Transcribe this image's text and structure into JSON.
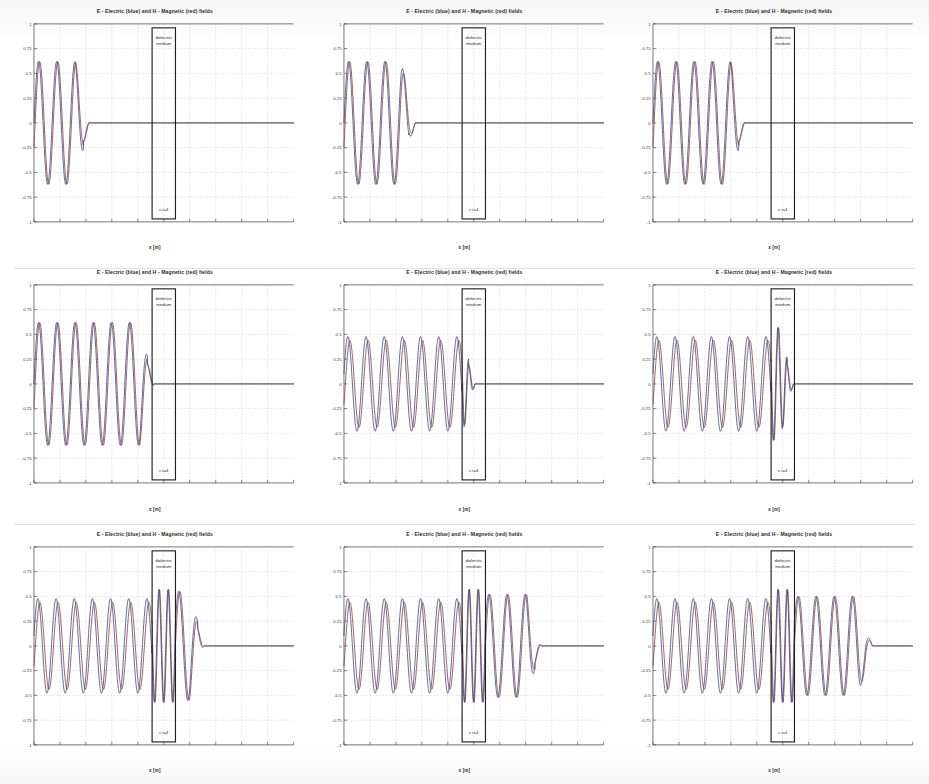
{
  "figure": {
    "kind": "fdtd-wave-snapshot-grid",
    "rows": 3,
    "cols": 3,
    "panel_count": 9
  },
  "plot_common": {
    "title": "E - Electric (blue) and H - Magnetic (red) fields",
    "xlabel": "x [m]",
    "ylabel": "",
    "dielectric_label_line1": "dielectric",
    "dielectric_label_line2": "medium",
    "dielectric_epsilon_label": "ε r=4",
    "grid": "on",
    "legend": "none",
    "colors": {
      "electric_field": "#4b4b7a",
      "magnetic_field": "#7a4b4b",
      "axis": "#3a3a3a",
      "gridline": "#b9b9c4",
      "dielectric_box": "#1f1f1f",
      "background": "#ffffff"
    }
  },
  "axes": {
    "ylim": [
      -1,
      1
    ],
    "yticks": [
      1,
      0.75,
      0.5,
      0.25,
      0,
      -0.25,
      -0.5,
      -0.75,
      -1
    ],
    "ytick_labels": [
      "1",
      "0.75",
      "0.5",
      "0.25",
      "0",
      "-0.25",
      "-0.5",
      "-0.75",
      "-1"
    ],
    "xlim": [
      0,
      10
    ],
    "xticks": [
      0,
      1,
      2,
      3,
      4,
      5,
      6,
      7,
      8,
      9,
      10
    ],
    "xtick_labels": [
      "",
      "",
      "",
      "",
      "",
      "",
      "",
      "",
      "",
      "",
      ""
    ],
    "dielectric_x_start": 4.55,
    "dielectric_x_end": 5.45
  },
  "chart_data": {
    "type": "line",
    "title": "E - Electric (blue) and H - Magnetic (red) fields",
    "xlabel": "x [m]",
    "ylabel": "",
    "xlim": [
      0,
      10
    ],
    "ylim": [
      -1,
      1
    ],
    "grid": true,
    "legend_position": "none",
    "annotations": [
      {
        "text": "dielectric medium",
        "x": 5.0,
        "y": 0.88
      },
      {
        "text": "ε r=4",
        "x": 5.0,
        "y": -0.82
      }
    ],
    "regions": [
      {
        "name": "free-space-left",
        "x_range": [
          0,
          4.55
        ],
        "epsilon_r": 1
      },
      {
        "name": "dielectric-slab",
        "x_range": [
          4.55,
          5.45
        ],
        "epsilon_r": 4
      },
      {
        "name": "free-space-right",
        "x_range": [
          5.45,
          10
        ],
        "epsilon_r": 1
      }
    ],
    "series": [
      {
        "name": "E - Electric field",
        "color": "#4b4b7a"
      },
      {
        "name": "H - Magnetic field",
        "color": "#7a4b4b"
      }
    ],
    "panels": [
      {
        "index": 1,
        "row": 1,
        "col": 1,
        "snapshot": "early",
        "wave_front_x": 2.15,
        "wave_tail_x": 0.0,
        "cycles_visible": 3,
        "wavelength_free": 0.7,
        "amplitude": 0.62,
        "in_dielectric": false,
        "transmitted": false,
        "reflected": false
      },
      {
        "index": 2,
        "row": 1,
        "col": 2,
        "snapshot": "early",
        "wave_front_x": 2.75,
        "wave_tail_x": 0.0,
        "cycles_visible": 4,
        "wavelength_free": 0.7,
        "amplitude": 0.62,
        "in_dielectric": false,
        "transmitted": false,
        "reflected": false
      },
      {
        "index": 3,
        "row": 1,
        "col": 3,
        "snapshot": "early",
        "wave_front_x": 3.55,
        "wave_tail_x": 0.0,
        "cycles_visible": 6,
        "wavelength_free": 0.7,
        "amplitude": 0.62,
        "in_dielectric": false,
        "transmitted": false,
        "reflected": false
      },
      {
        "index": 4,
        "row": 2,
        "col": 1,
        "snapshot": "arriving-at-slab",
        "wave_front_x": 4.62,
        "wave_tail_x": 0.0,
        "cycles_visible": 9,
        "wavelength_free": 0.7,
        "amplitude": 0.62,
        "in_dielectric": false,
        "transmitted": false,
        "reflected": false
      },
      {
        "index": 5,
        "row": 2,
        "col": 2,
        "snapshot": "entering-slab",
        "wave_front_x": 5.05,
        "wave_tail_x": 0.0,
        "cycles_visible": 10,
        "wavelength_free": 0.7,
        "wavelength_dielectric": 0.35,
        "amplitude": 0.62,
        "in_dielectric": true,
        "transmitted": false,
        "reflected": true
      },
      {
        "index": 6,
        "row": 2,
        "col": 3,
        "snapshot": "filling-slab",
        "wave_front_x": 5.42,
        "wave_tail_x": 0.0,
        "cycles_visible": 11,
        "wavelength_free": 0.7,
        "wavelength_dielectric": 0.35,
        "amplitude": 0.62,
        "in_dielectric": true,
        "transmitted": false,
        "reflected": true
      },
      {
        "index": 7,
        "row": 3,
        "col": 1,
        "snapshot": "first-transmission",
        "wave_front_x": 6.55,
        "wave_tail_x": 0.0,
        "cycles_visible": 12,
        "wavelength_free": 0.7,
        "wavelength_dielectric": 0.35,
        "amplitude": 0.62,
        "transmitted_amplitude": 0.55,
        "in_dielectric": true,
        "transmitted": true,
        "reflected": true
      },
      {
        "index": 8,
        "row": 3,
        "col": 2,
        "snapshot": "transmitting",
        "wave_front_x": 7.6,
        "wave_tail_x": 0.0,
        "cycles_visible": 13,
        "wavelength_free": 0.7,
        "wavelength_dielectric": 0.35,
        "amplitude": 0.62,
        "transmitted_amplitude": 0.52,
        "in_dielectric": true,
        "transmitted": true,
        "reflected": true
      },
      {
        "index": 9,
        "row": 3,
        "col": 3,
        "snapshot": "fully-transmitting",
        "wave_front_x": 8.45,
        "wave_tail_x": 0.0,
        "cycles_visible": 14,
        "wavelength_free": 0.7,
        "wavelength_dielectric": 0.35,
        "amplitude": 0.62,
        "transmitted_amplitude": 0.5,
        "in_dielectric": true,
        "transmitted": true,
        "reflected": true
      }
    ]
  }
}
